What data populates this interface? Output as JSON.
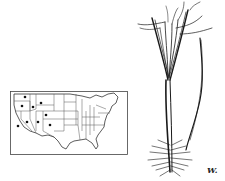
{
  "figure": {
    "type": "botanical-illustration-with-range-map",
    "map": {
      "region": "United States",
      "marker_color": "#111111",
      "line_color": "#333333",
      "occurrence_states": [
        "WA",
        "OR",
        "ID",
        "MT",
        "WY",
        "CA",
        "NV",
        "UT",
        "CO"
      ],
      "markers": [
        {
          "state": "WA",
          "x": 15,
          "y": 6
        },
        {
          "state": "OR",
          "x": 12,
          "y": 15
        },
        {
          "state": "ID",
          "x": 23,
          "y": 16
        },
        {
          "state": "MT",
          "x": 31,
          "y": 12
        },
        {
          "state": "WY",
          "x": 36,
          "y": 24
        },
        {
          "state": "CA",
          "x": 8,
          "y": 35
        },
        {
          "state": "NV",
          "x": 17,
          "y": 31
        },
        {
          "state": "UT",
          "x": 28,
          "y": 31
        },
        {
          "state": "CO",
          "x": 40,
          "y": 34
        }
      ]
    },
    "plant": {
      "subject": "grass plant drawing",
      "line_color": "#1a1a1a"
    },
    "signature": "W."
  }
}
